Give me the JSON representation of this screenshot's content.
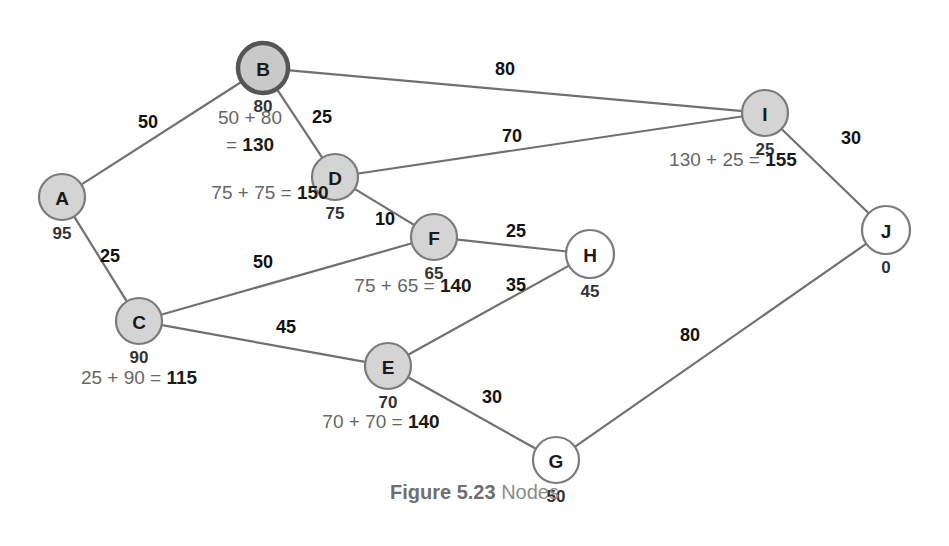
{
  "figure": {
    "caption_label": "Figure 5.23",
    "caption_text": "Nodes"
  },
  "colors": {
    "visited_fill": "#d4d4d4",
    "unvisited_fill": "#ffffff",
    "node_stroke": "#7a7a7a",
    "current_stroke": "#555555",
    "edge_stroke": "#707070",
    "label_text": "#1a1a1a",
    "calc_text": "#666666",
    "caption_text": "#8c8c8c"
  },
  "chart_data": {
    "type": "diagram",
    "title": "Figure 5.23 Nodes",
    "nodes": [
      {
        "id": "A",
        "label": "A",
        "distance": "95",
        "x": 62,
        "y": 197,
        "r": 23,
        "state": "visited"
      },
      {
        "id": "B",
        "label": "B",
        "distance": "80",
        "x": 263,
        "y": 68,
        "r": 25,
        "state": "current"
      },
      {
        "id": "C",
        "label": "C",
        "distance": "90",
        "x": 139,
        "y": 321,
        "r": 23,
        "state": "visited"
      },
      {
        "id": "D",
        "label": "D",
        "distance": "75",
        "x": 335,
        "y": 177,
        "r": 23,
        "state": "visited"
      },
      {
        "id": "E",
        "label": "E",
        "distance": "70",
        "x": 388,
        "y": 366,
        "r": 23,
        "state": "visited"
      },
      {
        "id": "F",
        "label": "F",
        "distance": "65",
        "x": 434,
        "y": 237,
        "r": 23,
        "state": "visited"
      },
      {
        "id": "G",
        "label": "G",
        "distance": "50",
        "x": 556,
        "y": 460,
        "r": 23,
        "state": "unvisited"
      },
      {
        "id": "H",
        "label": "H",
        "distance": "45",
        "x": 590,
        "y": 254,
        "r": 24,
        "state": "unvisited"
      },
      {
        "id": "I",
        "label": "I",
        "distance": "25",
        "x": 765,
        "y": 113,
        "r": 23,
        "state": "visited"
      },
      {
        "id": "J",
        "label": "J",
        "distance": "0",
        "x": 886,
        "y": 230,
        "r": 24,
        "state": "unvisited"
      }
    ],
    "edges": [
      {
        "from": "A",
        "to": "B",
        "weight": "50",
        "label_x": 148,
        "label_y": 128
      },
      {
        "from": "A",
        "to": "C",
        "weight": "25",
        "label_x": 110,
        "label_y": 262
      },
      {
        "from": "B",
        "to": "I",
        "weight": "80",
        "label_x": 505,
        "label_y": 75
      },
      {
        "from": "B",
        "to": "D",
        "weight": "25",
        "label_x": 322,
        "label_y": 123
      },
      {
        "from": "D",
        "to": "I",
        "weight": "70",
        "label_x": 512,
        "label_y": 142
      },
      {
        "from": "D",
        "to": "F",
        "weight": "10",
        "label_x": 385,
        "label_y": 225
      },
      {
        "from": "C",
        "to": "F",
        "weight": "50",
        "label_x": 263,
        "label_y": 268
      },
      {
        "from": "C",
        "to": "E",
        "weight": "45",
        "label_x": 286,
        "label_y": 333
      },
      {
        "from": "F",
        "to": "H",
        "weight": "25",
        "label_x": 516,
        "label_y": 237
      },
      {
        "from": "E",
        "to": "H",
        "weight": "35",
        "label_x": 516,
        "label_y": 291
      },
      {
        "from": "E",
        "to": "G",
        "weight": "30",
        "label_x": 492,
        "label_y": 403
      },
      {
        "from": "G",
        "to": "J",
        "weight": "80",
        "label_x": 690,
        "label_y": 341
      },
      {
        "from": "I",
        "to": "J",
        "weight": "30",
        "label_x": 851,
        "label_y": 144
      }
    ],
    "calculations": [
      {
        "node": "B",
        "lines": [
          "50 + 80",
          "= 130"
        ],
        "totals": [
          "",
          "130"
        ],
        "x": 250,
        "y": 124,
        "line_height": 27
      },
      {
        "node": "D",
        "lines": [
          "75 + 75 = 150"
        ],
        "totals": [
          "150"
        ],
        "x": 270,
        "y": 199,
        "line_height": 27
      },
      {
        "node": "C",
        "lines": [
          "25 + 90 = 115"
        ],
        "totals": [
          "115"
        ],
        "x": 139,
        "y": 384,
        "line_height": 27
      },
      {
        "node": "F",
        "lines": [
          "75 + 65 = 140"
        ],
        "totals": [
          "140"
        ],
        "x": 413,
        "y": 292,
        "line_height": 27
      },
      {
        "node": "E",
        "lines": [
          "70 + 70 = 140"
        ],
        "totals": [
          "140"
        ],
        "x": 381,
        "y": 428,
        "line_height": 27
      },
      {
        "node": "I",
        "lines": [
          "130 + 25 = 155"
        ],
        "totals": [
          "155"
        ],
        "x": 733,
        "y": 166,
        "line_height": 27
      }
    ]
  }
}
